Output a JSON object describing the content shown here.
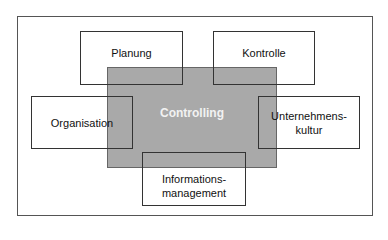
{
  "diagram": {
    "center": {
      "label": "Controlling",
      "fill": "#a9a9a9"
    },
    "nodes": [
      {
        "id": "planung",
        "label": "Planung"
      },
      {
        "id": "kontrolle",
        "label": "Kontrolle"
      },
      {
        "id": "organisation",
        "label": "Organisation"
      },
      {
        "id": "unternehmenskultur",
        "label": "Unternehmens-\nkultur"
      },
      {
        "id": "informationsmanagement",
        "label": "Informations-\nmanagement"
      }
    ]
  }
}
